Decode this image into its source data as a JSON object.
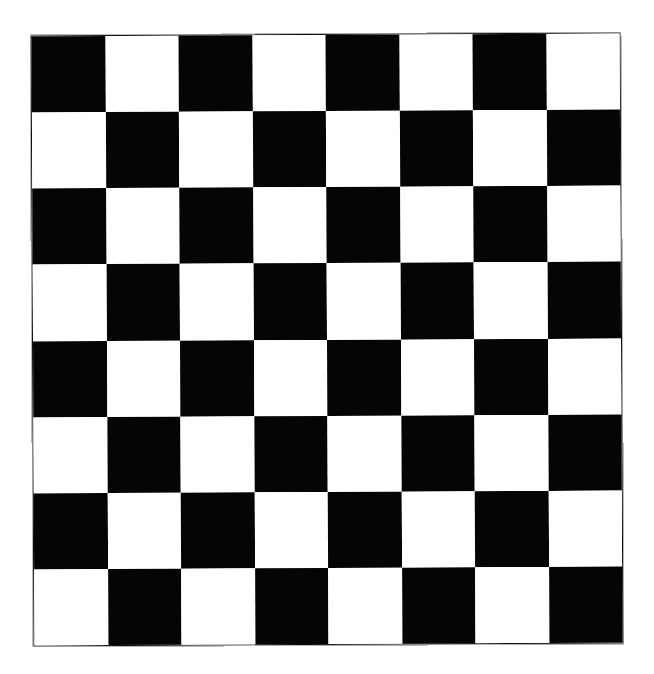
{
  "page": {
    "background_color": "#ffffff",
    "width": 654,
    "height": 674
  },
  "board": {
    "title": "Checkerboard",
    "rows": 8,
    "columns": 8,
    "square_count": 64,
    "dark_color": "#050505",
    "light_color": "#ffffff",
    "border_color": "#0b0b0b",
    "top_left_square_color": "dark",
    "left_px": 32,
    "top_px": 34,
    "width_px": 590,
    "height_px": 611,
    "square_width_px": 73.75,
    "square_height_px": 76.4,
    "rotation_deg": -0.28
  },
  "chart_data": {
    "type": "heatmap",
    "xlabel": "",
    "ylabel": "",
    "categories": [
      "1",
      "2",
      "3",
      "4",
      "5",
      "6",
      "7",
      "8"
    ],
    "row_labels": [
      "1",
      "2",
      "3",
      "4",
      "5",
      "6",
      "7",
      "8"
    ],
    "legend": [],
    "grid": false,
    "colors": [
      "#050505",
      "#ffffff"
    ],
    "values": [
      [
        1,
        0,
        1,
        0,
        1,
        0,
        1,
        0
      ],
      [
        0,
        1,
        0,
        1,
        0,
        1,
        0,
        1
      ],
      [
        1,
        0,
        1,
        0,
        1,
        0,
        1,
        0
      ],
      [
        0,
        1,
        0,
        1,
        0,
        1,
        0,
        1
      ],
      [
        1,
        0,
        1,
        0,
        1,
        0,
        1,
        0
      ],
      [
        0,
        1,
        0,
        1,
        0,
        1,
        0,
        1
      ],
      [
        1,
        0,
        1,
        0,
        1,
        0,
        1,
        0
      ],
      [
        0,
        1,
        0,
        1,
        0,
        1,
        0,
        1
      ]
    ]
  }
}
